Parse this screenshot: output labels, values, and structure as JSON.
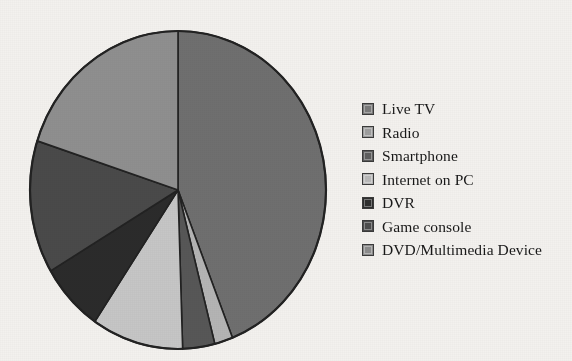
{
  "chart_data": {
    "type": "pie",
    "title": "",
    "subtitle": "",
    "xlabel": "",
    "ylabel": "",
    "grid": false,
    "legend_position": "right",
    "start_angle_deg": 0,
    "direction": "clockwise",
    "categories": [
      "Live TV",
      "Radio",
      "Smartphone",
      "Internet on PC",
      "DVR",
      "Game console",
      "DVD/Multimedia Device"
    ],
    "values": [
      44.0,
      2.0,
      3.5,
      10.0,
      7.0,
      13.5,
      20.0
    ],
    "units": "percent",
    "colors": [
      "#6f6f6f",
      "#b4b4b4",
      "#575757",
      "#c6c6c6",
      "#2b2b2b",
      "#4a4a4a",
      "#8f8f8f"
    ],
    "slices": [
      {
        "label": "Live TV",
        "value": 44.0,
        "color": "#6f6f6f"
      },
      {
        "label": "Radio",
        "value": 2.0,
        "color": "#b4b4b4"
      },
      {
        "label": "Smartphone",
        "value": 3.5,
        "color": "#575757"
      },
      {
        "label": "Internet on PC",
        "value": 10.0,
        "color": "#c6c6c6"
      },
      {
        "label": "DVR",
        "value": 7.0,
        "color": "#2b2b2b"
      },
      {
        "label": "Game console",
        "value": 13.5,
        "color": "#4a4a4a"
      },
      {
        "label": "DVD/Multimedia Device",
        "value": 20.0,
        "color": "#8f8f8f"
      }
    ]
  },
  "legend": {
    "items": [
      {
        "label": "Live TV",
        "color": "#7a7a7a"
      },
      {
        "label": "Radio",
        "color": "#9e9e9e"
      },
      {
        "label": "Smartphone",
        "color": "#5e5e5e"
      },
      {
        "label": "Internet on PC",
        "color": "#b9b9b9"
      },
      {
        "label": "DVR",
        "color": "#2e2e2e"
      },
      {
        "label": "Game console",
        "color": "#4d4d4d"
      },
      {
        "label": "DVD/Multimedia Device",
        "color": "#8c8c8c"
      }
    ]
  },
  "style": {
    "background": "#f3f1ee",
    "outline": "#222222",
    "text": "#181818"
  },
  "geometry": {
    "cx": 178,
    "cy": 190,
    "rx": 148,
    "ry": 159
  }
}
